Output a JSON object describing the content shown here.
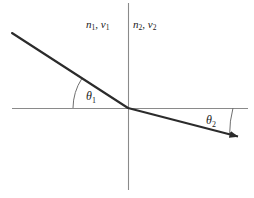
{
  "figure": {
    "background_color": "#ffffff",
    "width": 254,
    "height": 198
  },
  "labels": {
    "medium1": {
      "symbol_n": "n",
      "sub_n": "1",
      "separator": ", ",
      "symbol_v": "v",
      "sub_v": "1"
    },
    "medium2": {
      "symbol_n": "n",
      "sub_n": "2",
      "separator": ", ",
      "symbol_v": "v",
      "sub_v": "2"
    },
    "angle1": {
      "symbol": "θ",
      "sub": "1"
    },
    "angle2": {
      "symbol": "θ",
      "sub": "2"
    }
  },
  "colors": {
    "ray": "#2b2b2b",
    "axis": "#8a8a8a",
    "arc": "#6f6f6f",
    "text": "#1a1a1a"
  },
  "geometry": {
    "origin": {
      "x": 128,
      "y": 108
    },
    "horizontal_axis": {
      "x1": 12,
      "y1": 108,
      "x2": 248,
      "y2": 108
    },
    "vertical_axis": {
      "x1": 128,
      "y1": 3,
      "x2": 128,
      "y2": 190
    },
    "incident_ray": {
      "x1": 12,
      "y1": 33,
      "x2": 128,
      "y2": 108
    },
    "refracted_ray": {
      "x1": 128,
      "y1": 108,
      "x2": 240,
      "y2": 137
    },
    "arc1": {
      "radius": 55,
      "from_deg": 180,
      "to_deg": 213
    },
    "arc2": {
      "radius": 105,
      "from_deg": 0,
      "to_deg": 14.5
    }
  }
}
